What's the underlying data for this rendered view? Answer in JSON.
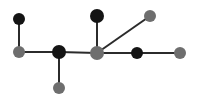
{
  "figure": {
    "title": "",
    "background_color": "#ffffff",
    "width": 197,
    "height": 106
  },
  "chart_data": {
    "type": "scatter",
    "title": "",
    "subtitle": "",
    "xlabel": "",
    "ylabel": "",
    "grid": false,
    "legend": null,
    "node_colors": {
      "black": "#141414",
      "gray": "#6e6e6e"
    },
    "edge_color": "#2b2b2b",
    "edge_width": 2,
    "node_radius": 6,
    "xlim": [
      0,
      197
    ],
    "ylim": [
      0,
      106
    ],
    "nodes": [
      {
        "id": "n1",
        "label": "top-left-black",
        "x": 19,
        "y": 19,
        "color": "black",
        "r": 6,
        "degree": 1
      },
      {
        "id": "n2",
        "label": "left-gray",
        "x": 19,
        "y": 52,
        "color": "gray",
        "r": 6,
        "degree": 2
      },
      {
        "id": "n3",
        "label": "left-hub-black",
        "x": 59,
        "y": 52,
        "color": "black",
        "r": 7,
        "degree": 3
      },
      {
        "id": "n4",
        "label": "bottom-gray",
        "x": 59,
        "y": 88,
        "color": "gray",
        "r": 6,
        "degree": 1
      },
      {
        "id": "n5",
        "label": "top-center-black",
        "x": 97,
        "y": 16,
        "color": "black",
        "r": 7,
        "degree": 1
      },
      {
        "id": "n6",
        "label": "center-hub-gray",
        "x": 97,
        "y": 53,
        "color": "gray",
        "r": 7,
        "degree": 4
      },
      {
        "id": "n7",
        "label": "upper-right-gray",
        "x": 150,
        "y": 16,
        "color": "gray",
        "r": 6,
        "degree": 1
      },
      {
        "id": "n8",
        "label": "right-black",
        "x": 137,
        "y": 53,
        "color": "black",
        "r": 6,
        "degree": 2
      },
      {
        "id": "n9",
        "label": "far-right-gray",
        "x": 180,
        "y": 53,
        "color": "gray",
        "r": 6,
        "degree": 1
      }
    ],
    "edges": [
      {
        "id": "e1",
        "source": "n1",
        "target": "n2",
        "orientation": "vertical"
      },
      {
        "id": "e2",
        "source": "n2",
        "target": "n3",
        "orientation": "horizontal"
      },
      {
        "id": "e3",
        "source": "n3",
        "target": "n4",
        "orientation": "vertical"
      },
      {
        "id": "e4",
        "source": "n3",
        "target": "n6",
        "orientation": "horizontal"
      },
      {
        "id": "e5",
        "source": "n5",
        "target": "n6",
        "orientation": "vertical"
      },
      {
        "id": "e6",
        "source": "n6",
        "target": "n7",
        "orientation": "diagonal"
      },
      {
        "id": "e7",
        "source": "n6",
        "target": "n8",
        "orientation": "horizontal"
      },
      {
        "id": "e8",
        "source": "n8",
        "target": "n9",
        "orientation": "horizontal"
      }
    ],
    "counts": {
      "nodes_total": 9,
      "nodes_black": 4,
      "nodes_gray": 5,
      "edges_total": 8
    }
  }
}
